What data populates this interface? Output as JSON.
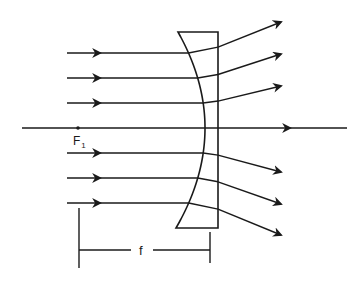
{
  "diagram": {
    "colors": {
      "ink": "#1a1a1a",
      "background": "#ffffff"
    },
    "labels": {
      "focal_point": "F",
      "focal_point_subscript": "1",
      "focal_length": "f"
    },
    "optical_axis": {
      "y": 128,
      "x_start": 22,
      "x_end": 347,
      "arrow_x": 290
    },
    "focal_point": {
      "x": 78,
      "y": 128
    },
    "lens": {
      "type": "plano-concave",
      "top_left": [
        178,
        32
      ],
      "top_right": [
        218,
        32
      ],
      "bottom_right": [
        218,
        228
      ],
      "bottom_left": [
        176,
        228
      ],
      "concave_apex_x": 205
    },
    "incident_rays": [
      {
        "y": 53,
        "x_start": 67,
        "arrow_x": 100,
        "exit": [
          281,
          22
        ]
      },
      {
        "y": 78,
        "x_start": 67,
        "arrow_x": 100,
        "exit": [
          281,
          54
        ]
      },
      {
        "y": 103,
        "x_start": 67,
        "arrow_x": 100,
        "exit": [
          281,
          86
        ]
      },
      {
        "y": 153,
        "x_start": 67,
        "arrow_x": 100,
        "exit": [
          281,
          172
        ]
      },
      {
        "y": 178,
        "x_start": 67,
        "arrow_x": 100,
        "exit": [
          281,
          204
        ]
      },
      {
        "y": 203,
        "x_start": 67,
        "arrow_x": 100,
        "exit": [
          281,
          235
        ]
      }
    ],
    "dimension": {
      "left_tick_x": 79,
      "left_tick_y": [
        208,
        268
      ],
      "right_tick_x": 210,
      "right_tick_y": [
        232,
        263
      ],
      "line_y": 250,
      "label_x": 141
    }
  }
}
